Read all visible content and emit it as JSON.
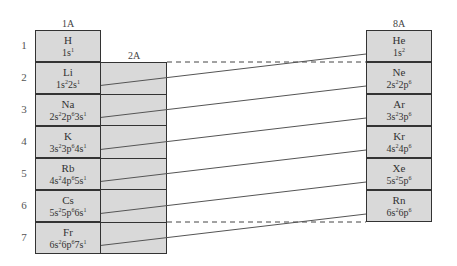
{
  "groups": {
    "g1": "1A",
    "g2": "2A",
    "g8": "8A"
  },
  "periods": [
    "1",
    "2",
    "3",
    "4",
    "5",
    "6",
    "7"
  ],
  "alkali": [
    {
      "symbol": "H",
      "config": [
        [
          "1s",
          "1"
        ]
      ]
    },
    {
      "symbol": "Li",
      "config": [
        [
          "1s",
          "2"
        ],
        [
          "2s",
          "1"
        ]
      ]
    },
    {
      "symbol": "Na",
      "config": [
        [
          "2s",
          "2"
        ],
        [
          "2p",
          "6"
        ],
        [
          "3s",
          "1"
        ]
      ]
    },
    {
      "symbol": "K",
      "config": [
        [
          "3s",
          "2"
        ],
        [
          "3p",
          "6"
        ],
        [
          "4s",
          "1"
        ]
      ]
    },
    {
      "symbol": "Rb",
      "config": [
        [
          "4s",
          "2"
        ],
        [
          "4p",
          "6"
        ],
        [
          "5s",
          "1"
        ]
      ]
    },
    {
      "symbol": "Cs",
      "config": [
        [
          "5s",
          "2"
        ],
        [
          "5p",
          "6"
        ],
        [
          "6s",
          "1"
        ]
      ]
    },
    {
      "symbol": "Fr",
      "config": [
        [
          "6s",
          "2"
        ],
        [
          "6p",
          "6"
        ],
        [
          "7s",
          "1"
        ]
      ]
    }
  ],
  "noble": [
    {
      "symbol": "He",
      "config": [
        [
          "1s",
          "2"
        ]
      ]
    },
    {
      "symbol": "Ne",
      "config": [
        [
          "2s",
          "2"
        ],
        [
          "2p",
          "6"
        ]
      ]
    },
    {
      "symbol": "Ar",
      "config": [
        [
          "3s",
          "2"
        ],
        [
          "3p",
          "6"
        ]
      ]
    },
    {
      "symbol": "Kr",
      "config": [
        [
          "4s",
          "2"
        ],
        [
          "4p",
          "6"
        ]
      ]
    },
    {
      "symbol": "Xe",
      "config": [
        [
          "5s",
          "2"
        ],
        [
          "5p",
          "6"
        ]
      ]
    },
    {
      "symbol": "Rn",
      "config": [
        [
          "6s",
          "2"
        ],
        [
          "6p",
          "6"
        ]
      ]
    }
  ],
  "colors": {
    "cell_fill": "#d9d9d9",
    "border": "#333333",
    "arrow": "#555555"
  }
}
